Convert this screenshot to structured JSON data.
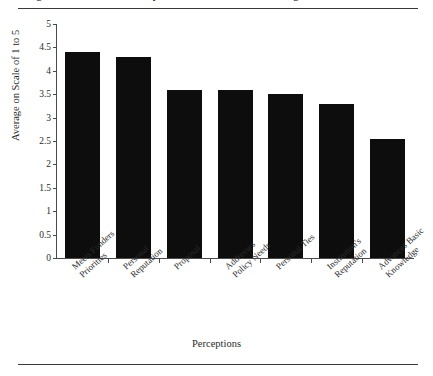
{
  "figure": {
    "caption": "Figure 3.7   Researchers' Perceptions of What Influences Funding"
  },
  "chart_data": {
    "type": "bar",
    "title": "Figure 3.7   Researchers' Perceptions of What Influences Funding",
    "xlabel": "Perceptions",
    "ylabel": "Average on Scale of 1 to 5",
    "ylim": [
      0,
      5
    ],
    "ytick_labels": [
      "5",
      "4.5",
      "4",
      "3.5",
      "3",
      "2.5",
      "2",
      "1.5",
      "1",
      "0.5",
      "0"
    ],
    "ytick_values": [
      5,
      4.5,
      4,
      3.5,
      3,
      2.5,
      2,
      1.5,
      1,
      0.5,
      0
    ],
    "grid": false,
    "legend": "none",
    "bar_color": "#0d0d0d",
    "categories": [
      "Meets Funders\nPriorities",
      "Personal\nReputation",
      "Proposal",
      "Addresses\nPolicy Needs",
      "Personal Ties",
      "Institution's\nReputation",
      "Advances Basic\nKnowledge"
    ],
    "values": [
      4.4,
      4.3,
      3.6,
      3.6,
      3.5,
      3.3,
      2.55
    ]
  }
}
